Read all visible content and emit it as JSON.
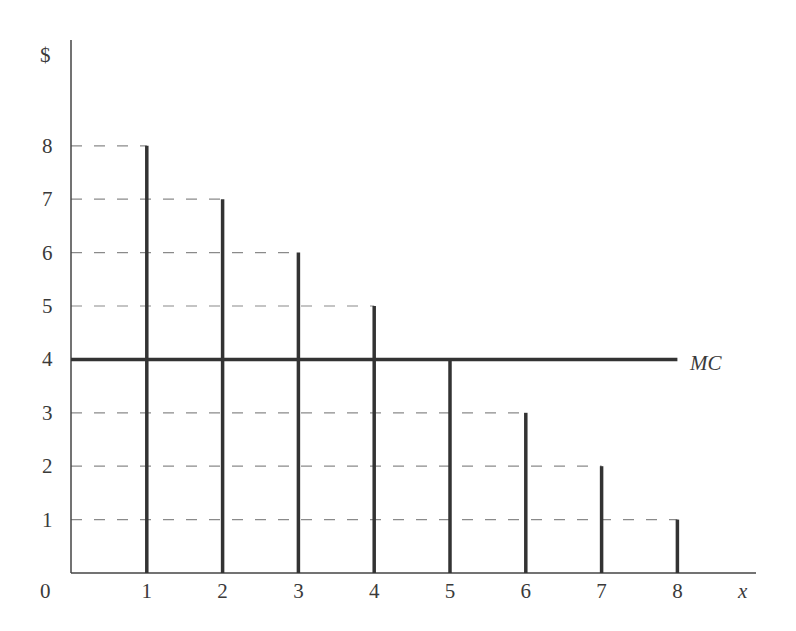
{
  "chart_data": {
    "type": "bar",
    "title": "",
    "xlabel": "x",
    "ylabel": "$",
    "categories": [
      "1",
      "2",
      "3",
      "4",
      "5",
      "6",
      "7",
      "8"
    ],
    "series": [
      {
        "name": "Marginal benefit (stems)",
        "values": [
          8,
          7,
          6,
          5,
          4,
          3,
          2,
          1
        ]
      },
      {
        "name": "MC",
        "type": "line",
        "values": [
          4,
          4,
          4,
          4,
          4,
          4,
          4,
          4
        ]
      }
    ],
    "x_ticks": [
      "0",
      "1",
      "2",
      "3",
      "4",
      "5",
      "6",
      "7",
      "8"
    ],
    "y_ticks": [
      "1",
      "2",
      "3",
      "4",
      "5",
      "6",
      "7",
      "8"
    ],
    "annotations": [
      {
        "text": "MC",
        "at": {
          "x": 8,
          "y": 4
        }
      }
    ],
    "origin_label": "0",
    "xlim": [
      0,
      8.8
    ],
    "ylim": [
      0,
      10
    ],
    "grid": false,
    "dashed_guides": true,
    "legend": "none"
  },
  "colors": {
    "axis": "#444444",
    "bars": "#333333",
    "mc_line": "#333333",
    "guides": "#8a8a8a",
    "text": "#3a3a3a"
  }
}
